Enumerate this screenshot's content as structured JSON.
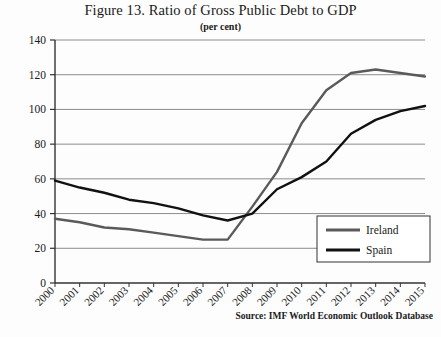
{
  "figure": {
    "title": "Figure 13. Ratio of Gross Public Debt to GDP",
    "subtitle": "(per cent)",
    "source": "Source: IMF World Economic Outlook Database"
  },
  "chart_data": {
    "type": "line",
    "title": "Figure 13. Ratio of Gross Public Debt to GDP",
    "subtitle": "(per cent)",
    "xlabel": "",
    "ylabel": "",
    "ylim": [
      0,
      140
    ],
    "yticks": [
      0,
      20,
      40,
      60,
      80,
      100,
      120,
      140
    ],
    "grid": true,
    "legend_position": "bottom-right",
    "categories": [
      "2000",
      "2001",
      "2002",
      "2003",
      "2004",
      "2005",
      "2006",
      "2007",
      "2008",
      "2009",
      "2010",
      "2011",
      "2012",
      "2013",
      "2014",
      "2015"
    ],
    "series": [
      {
        "name": "Ireland",
        "color": "#5a5a5a",
        "values": [
          37,
          35,
          32,
          31,
          29,
          27,
          25,
          25,
          44,
          64,
          92,
          111,
          121,
          123,
          121,
          119
        ]
      },
      {
        "name": "Spain",
        "color": "#111111",
        "values": [
          59,
          55,
          52,
          48,
          46,
          43,
          39,
          36,
          40,
          54,
          61,
          70,
          86,
          94,
          99,
          102
        ]
      }
    ]
  },
  "legend": {
    "items": [
      {
        "label": "Ireland",
        "color": "#5a5a5a"
      },
      {
        "label": "Spain",
        "color": "#111111"
      }
    ]
  }
}
